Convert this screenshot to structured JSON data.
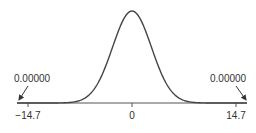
{
  "chart_data": {
    "type": "line",
    "title": "",
    "xlabel": "",
    "ylabel": "",
    "x_ticks": [
      -14.7,
      0,
      14.7
    ],
    "x_tick_labels": [
      "−14.7",
      "0",
      "14.7"
    ],
    "xlim": [
      -16.3,
      16.3
    ],
    "grid": false,
    "legend": null,
    "series": [
      {
        "name": "density",
        "mean": 0,
        "sd": 2.75,
        "x": [
          -14.7,
          -10,
          -7.5,
          -5,
          -2.5,
          0,
          2.5,
          5,
          7.5,
          10,
          14.7
        ],
        "y_relative": [
          0.0,
          0.0013,
          0.0245,
          0.192,
          0.662,
          1.0,
          0.662,
          0.192,
          0.0245,
          0.0013,
          0.0
        ]
      }
    ],
    "annotations": [
      {
        "text": "0.00000",
        "points_to_x": -14.7,
        "side": "left"
      },
      {
        "text": "0.00000",
        "points_to_x": 14.7,
        "side": "right"
      }
    ]
  },
  "labels": {
    "left_annotation": "0.00000",
    "right_annotation": "0.00000",
    "tick_left": "−14.7",
    "tick_center": "0",
    "tick_right": "14.7"
  },
  "colors": {
    "curve": "#444444",
    "axis": "#555555",
    "text": "#333333"
  }
}
